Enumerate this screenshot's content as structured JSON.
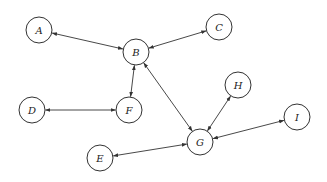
{
  "diagram": {
    "type": "undirected-bidirectional-graph",
    "node_radius": 13,
    "colors": {
      "stroke": "#333333",
      "fill": "#ffffff",
      "text": "#222222"
    },
    "nodes": [
      {
        "id": "A",
        "label": "A",
        "x": 39,
        "y": 30
      },
      {
        "id": "B",
        "label": "B",
        "x": 136,
        "y": 52
      },
      {
        "id": "C",
        "label": "C",
        "x": 219,
        "y": 27
      },
      {
        "id": "D",
        "label": "D",
        "x": 32,
        "y": 110
      },
      {
        "id": "F",
        "label": "F",
        "x": 129,
        "y": 110
      },
      {
        "id": "E",
        "label": "E",
        "x": 100,
        "y": 158
      },
      {
        "id": "G",
        "label": "G",
        "x": 200,
        "y": 142
      },
      {
        "id": "H",
        "label": "H",
        "x": 238,
        "y": 85
      },
      {
        "id": "I",
        "label": "I",
        "x": 297,
        "y": 117
      }
    ],
    "edges": [
      {
        "from": "A",
        "to": "B",
        "arrows": "both"
      },
      {
        "from": "B",
        "to": "C",
        "arrows": "both"
      },
      {
        "from": "B",
        "to": "F",
        "arrows": "both"
      },
      {
        "from": "D",
        "to": "F",
        "arrows": "both"
      },
      {
        "from": "B",
        "to": "G",
        "arrows": "both"
      },
      {
        "from": "H",
        "to": "G",
        "arrows": "both"
      },
      {
        "from": "I",
        "to": "G",
        "arrows": "both"
      },
      {
        "from": "E",
        "to": "G",
        "arrows": "both"
      }
    ]
  }
}
